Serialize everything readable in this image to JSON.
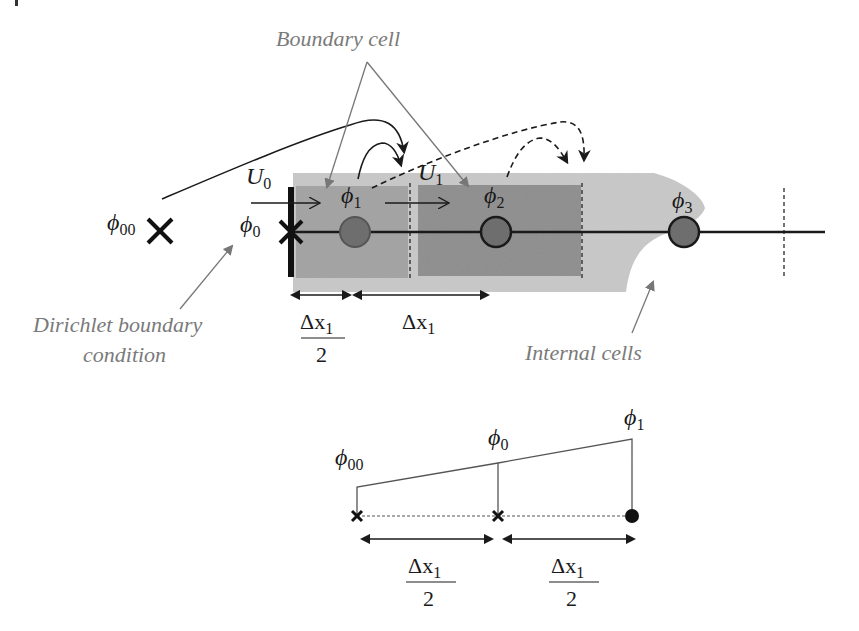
{
  "labels": {
    "boundary_cell": "Boundary cell",
    "dirichlet_line1": "Dirichlet boundary",
    "dirichlet_line2": "condition",
    "internal_cells": "Internal cells"
  },
  "top_diagram": {
    "phi00": {
      "sym": "ϕ",
      "sub": "00"
    },
    "phi0": {
      "sym": "ϕ",
      "sub": "0"
    },
    "phi1": {
      "sym": "ϕ",
      "sub": "1"
    },
    "phi2": {
      "sym": "ϕ",
      "sub": "2"
    },
    "phi3": {
      "sym": "ϕ",
      "sub": "3"
    },
    "U0": {
      "sym": "U",
      "sub": "0"
    },
    "U1": {
      "sym": "U",
      "sub": "1"
    },
    "dx_half": {
      "num": "Δx",
      "num_sub": "1",
      "den": "2"
    },
    "dx_full": {
      "sym": "Δx",
      "sub": "1"
    }
  },
  "bottom_diagram": {
    "phi00": {
      "sym": "ϕ",
      "sub": "00"
    },
    "phi0": {
      "sym": "ϕ",
      "sub": "0"
    },
    "phi1": {
      "sym": "ϕ",
      "sub": "1"
    },
    "dx_half_left": {
      "num": "Δx",
      "num_sub": "1",
      "den": "2"
    },
    "dx_half_right": {
      "num": "Δx",
      "num_sub": "1",
      "den": "2"
    }
  },
  "colors": {
    "outer_band": "#c8c8c8",
    "boundary_cell": "#a3a3a3",
    "internal_cell": "#8e8e8e",
    "node_fill": "#6e6e6e",
    "annotation_gray": "#7a7a7a",
    "ink": "#1a1a1a"
  }
}
